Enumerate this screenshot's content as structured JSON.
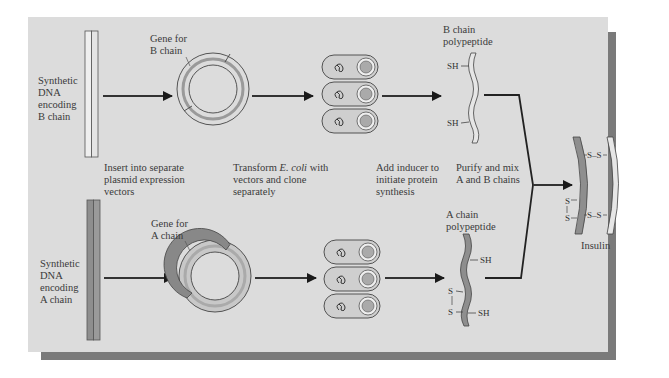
{
  "diagram": {
    "colors": {
      "panel": "#dcdcdc",
      "shadow": "#7a7a7a",
      "b_chain_fill": "#e8e8e8",
      "a_chain_fill": "#8c8c8c",
      "arrow": "#1a1a1a"
    },
    "b_row": {
      "dna_label": [
        "Synthetic",
        "DNA",
        "encoding",
        "B chain"
      ],
      "gene_label": [
        "Gene for",
        "B chain"
      ],
      "polypeptide_label": [
        "B chain",
        "polypeptide"
      ],
      "sh_groups": [
        "SH",
        "SH"
      ]
    },
    "a_row": {
      "dna_label": [
        "Synthetic",
        "DNA",
        "encoding",
        "A chain"
      ],
      "gene_label": [
        "Gene for",
        "A chain"
      ],
      "polypeptide_label": [
        "A chain",
        "polypeptide"
      ],
      "sh_groups": [
        "SH",
        "SH"
      ],
      "intrachain_disulfide": [
        "S",
        "S"
      ]
    },
    "steps": {
      "step1": [
        "Insert into separate",
        "plasmid expression",
        "vectors"
      ],
      "step2_prefix": "Transform ",
      "step2_italic": "E. coli",
      "step2_suffix": " with",
      "step2_rest": [
        "vectors and clone",
        "separately"
      ],
      "step3": [
        "Add inducer to",
        "initiate protein",
        "synthesis"
      ],
      "step4": [
        "Purify and mix",
        "A and B chains"
      ]
    },
    "product": {
      "label": "Insulin",
      "disulfide_bonds": [
        "S–S",
        "S–S"
      ],
      "intrachain": [
        "S",
        "S"
      ]
    },
    "cells": {
      "b_row_count": 3,
      "a_row_count": 3
    }
  }
}
